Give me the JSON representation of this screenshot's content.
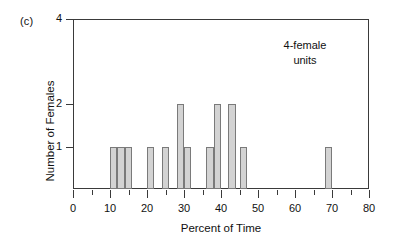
{
  "figure": {
    "panel_label": "(c)",
    "annotation": "4-female\nunits",
    "annotation_line1": "4-female",
    "annotation_line2": "units"
  },
  "chart_data": {
    "type": "bar",
    "title": "",
    "panel": "(c)",
    "xlabel": "Percent of Time",
    "ylabel": "Number of Females",
    "xlim": [
      0,
      80
    ],
    "ylim": [
      0,
      4
    ],
    "grid": false,
    "legend": null,
    "annotations": [
      {
        "text": "4-female units",
        "x": 62,
        "y": 3.3
      }
    ],
    "x_major_ticks": [
      0,
      10,
      20,
      30,
      40,
      50,
      60,
      70,
      80
    ],
    "x_tick_labels": [
      "0",
      "10",
      "20",
      "30",
      "40",
      "50",
      "60",
      "70",
      "80"
    ],
    "x_minor_ticks": [
      5,
      15,
      25,
      35,
      45,
      55,
      65,
      75
    ],
    "y_ticks": [
      1,
      2,
      4
    ],
    "y_tick_labels": [
      "1",
      "2",
      "4"
    ],
    "bar_width": 2,
    "bar_fill": "#d3d3d3",
    "bar_edge": "#7a7a7a",
    "categories": [
      10,
      12,
      14,
      20,
      24,
      28,
      30,
      36,
      38,
      42,
      45,
      68
    ],
    "values": [
      1,
      1,
      1,
      1,
      1,
      2,
      1,
      1,
      2,
      2,
      1,
      1
    ],
    "bars": [
      {
        "x": 10,
        "value": 1
      },
      {
        "x": 12,
        "value": 1
      },
      {
        "x": 14,
        "value": 1
      },
      {
        "x": 20,
        "value": 1
      },
      {
        "x": 24,
        "value": 1
      },
      {
        "x": 28,
        "value": 2
      },
      {
        "x": 30,
        "value": 1
      },
      {
        "x": 36,
        "value": 1
      },
      {
        "x": 38,
        "value": 2
      },
      {
        "x": 42,
        "value": 2
      },
      {
        "x": 45,
        "value": 1
      },
      {
        "x": 68,
        "value": 1
      }
    ]
  }
}
